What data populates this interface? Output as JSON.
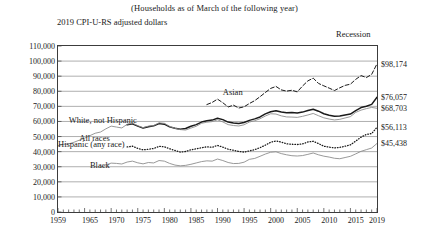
{
  "subtitle": "(Households as of March of the following year)",
  "y_caption": "2019 CPI-U-RS adjusted dollars",
  "recession_label": "Recession",
  "chart_data": {
    "type": "line",
    "title": "",
    "subtitle": "(Households as of March of the following year)",
    "xlabel": "",
    "ylabel": "2019 CPI-U-RS adjusted dollars",
    "xlim": [
      1959,
      2019
    ],
    "ylim": [
      0,
      110000
    ],
    "ytick_step": 10000,
    "grid": "horizontal",
    "legend": "inline-annotations",
    "ytick_labels": [
      "0",
      "10,000",
      "20,000",
      "30,000",
      "40,000",
      "50,000",
      "60,000",
      "70,000",
      "80,000",
      "90,000",
      "100,000",
      "110,000"
    ],
    "yticks": [
      0,
      10000,
      20000,
      30000,
      40000,
      50000,
      60000,
      70000,
      80000,
      90000,
      100000,
      110000
    ],
    "xtick_labels": [
      "1959",
      "1965",
      "1970",
      "1975",
      "1980",
      "1985",
      "1990",
      "1995",
      "2000",
      "2005",
      "2010",
      "2015",
      "2019"
    ],
    "xticks": [
      1959,
      1965,
      1970,
      1975,
      1980,
      1985,
      1990,
      1995,
      2000,
      2005,
      2010,
      2015,
      2019
    ],
    "endpoint_labels": [
      {
        "series": "Asian",
        "value": 98174,
        "text": "$98,174"
      },
      {
        "series": "White, not Hispanic",
        "value": 76057,
        "text": "$76,057"
      },
      {
        "series": "All races",
        "value": 68703,
        "text": "$68,703"
      },
      {
        "series": "Hispanic (any race)",
        "value": 56113,
        "text": "$56,113"
      },
      {
        "series": "Black",
        "value": 45438,
        "text": "$45,438"
      }
    ],
    "annotations": [
      {
        "text": "Asian",
        "x": 1990,
        "y": 79000
      },
      {
        "text": "White, not Hispanic",
        "x": 1961,
        "y": 60500
      },
      {
        "text": "All races",
        "x": 1963,
        "y": 48500
      },
      {
        "text": "Hispanic (any race)",
        "x": 1959,
        "y": 44500
      },
      {
        "text": "Black",
        "x": 1965,
        "y": 30500
      },
      {
        "text": "Recession",
        "x": 2017,
        "y": 115000
      }
    ],
    "series": [
      {
        "name": "Asian",
        "style": "dashed",
        "color": "#1a1a1a",
        "x": [
          1987,
          1988,
          1989,
          1990,
          1991,
          1992,
          1993,
          1994,
          1995,
          1996,
          1997,
          1998,
          1999,
          2000,
          2001,
          2002,
          2003,
          2004,
          2005,
          2006,
          2007,
          2008,
          2009,
          2010,
          2011,
          2012,
          2013,
          2014,
          2015,
          2016,
          2017,
          2018,
          2019
        ],
        "values": [
          71200,
          72600,
          74800,
          72400,
          69600,
          70800,
          68900,
          69700,
          71900,
          73800,
          76400,
          79200,
          81900,
          83200,
          80900,
          80100,
          80700,
          79600,
          83500,
          86900,
          88700,
          85200,
          83600,
          82100,
          80500,
          82300,
          83900,
          84700,
          87900,
          90400,
          89100,
          91200,
          98174
        ]
      },
      {
        "name": "White, not Hispanic",
        "style": "solid-thick",
        "color": "#1a1a1a",
        "x": [
          1972,
          1973,
          1974,
          1975,
          1976,
          1977,
          1978,
          1979,
          1980,
          1981,
          1982,
          1983,
          1984,
          1985,
          1986,
          1987,
          1988,
          1989,
          1990,
          1991,
          1992,
          1993,
          1994,
          1995,
          1996,
          1997,
          1998,
          1999,
          2000,
          2001,
          2002,
          2003,
          2004,
          2005,
          2006,
          2007,
          2008,
          2009,
          2010,
          2011,
          2012,
          2013,
          2014,
          2015,
          2016,
          2017,
          2018,
          2019
        ],
        "values": [
          57800,
          58400,
          56900,
          55600,
          56500,
          57100,
          58600,
          58200,
          56400,
          55500,
          54900,
          55300,
          56800,
          57900,
          59600,
          60400,
          60900,
          62100,
          61200,
          59600,
          59000,
          58600,
          59300,
          60700,
          61700,
          63000,
          65000,
          66400,
          67100,
          66200,
          65800,
          65900,
          65600,
          66200,
          67200,
          68100,
          66800,
          65100,
          64100,
          63400,
          63600,
          64300,
          64900,
          67200,
          69200,
          70100,
          71300,
          76057
        ]
      },
      {
        "name": "All races",
        "style": "solid-thin",
        "color": "#8d8d8d",
        "x": [
          1959,
          1960,
          1961,
          1962,
          1963,
          1964,
          1965,
          1966,
          1967,
          1968,
          1969,
          1970,
          1971,
          1972,
          1973,
          1974,
          1975,
          1976,
          1977,
          1978,
          1979,
          1980,
          1981,
          1982,
          1983,
          1984,
          1985,
          1986,
          1987,
          1988,
          1989,
          1990,
          1991,
          1992,
          1993,
          1994,
          1995,
          1996,
          1997,
          1998,
          1999,
          2000,
          2001,
          2002,
          2003,
          2004,
          2005,
          2006,
          2007,
          2008,
          2009,
          2010,
          2011,
          2012,
          2013,
          2014,
          2015,
          2016,
          2017,
          2018,
          2019
        ],
        "values": [
          43900,
          44800,
          45100,
          46200,
          47600,
          48900,
          50600,
          52200,
          53000,
          55100,
          56900,
          56300,
          55700,
          58100,
          58900,
          57200,
          55900,
          56900,
          57300,
          59100,
          58800,
          56700,
          55500,
          54600,
          54300,
          55600,
          56800,
          58800,
          59500,
          59900,
          61100,
          59700,
          57900,
          57300,
          57000,
          57800,
          59600,
          60500,
          61800,
          63600,
          65100,
          64900,
          63700,
          63000,
          62900,
          62700,
          63400,
          64300,
          65300,
          63800,
          62400,
          61600,
          61000,
          61400,
          62300,
          63200,
          66000,
          67500,
          68500,
          69300,
          68703
        ]
      },
      {
        "name": "Hispanic (any race)",
        "style": "dotted",
        "color": "#1a1a1a",
        "x": [
          1972,
          1973,
          1974,
          1975,
          1976,
          1977,
          1978,
          1979,
          1980,
          1981,
          1982,
          1983,
          1984,
          1985,
          1986,
          1987,
          1988,
          1989,
          1990,
          1991,
          1992,
          1993,
          1994,
          1995,
          1996,
          1997,
          1998,
          1999,
          2000,
          2001,
          2002,
          2003,
          2004,
          2005,
          2006,
          2007,
          2008,
          2009,
          2010,
          2011,
          2012,
          2013,
          2014,
          2015,
          2016,
          2017,
          2018,
          2019
        ],
        "values": [
          43100,
          43600,
          42200,
          41200,
          41600,
          42100,
          43500,
          43200,
          41900,
          40800,
          39700,
          40100,
          41200,
          41900,
          42600,
          43200,
          42900,
          44100,
          43000,
          41600,
          40900,
          40100,
          39700,
          40500,
          41300,
          42600,
          44300,
          46200,
          47100,
          46300,
          45200,
          44900,
          44700,
          45100,
          46400,
          46900,
          45300,
          43600,
          43000,
          42500,
          42800,
          43600,
          44500,
          47000,
          49600,
          51400,
          52000,
          56113
        ]
      },
      {
        "name": "Black",
        "style": "solid-thin",
        "color": "#8d8d8d",
        "x": [
          1967,
          1968,
          1969,
          1970,
          1971,
          1972,
          1973,
          1974,
          1975,
          1976,
          1977,
          1978,
          1979,
          1980,
          1981,
          1982,
          1983,
          1984,
          1985,
          1986,
          1987,
          1988,
          1989,
          1990,
          1991,
          1992,
          1993,
          1994,
          1995,
          1996,
          1997,
          1998,
          1999,
          2000,
          2001,
          2002,
          2003,
          2004,
          2005,
          2006,
          2007,
          2008,
          2009,
          2010,
          2011,
          2012,
          2013,
          2014,
          2015,
          2016,
          2017,
          2018,
          2019
        ],
        "values": [
          29600,
          31200,
          32400,
          32200,
          31800,
          33100,
          33700,
          32600,
          31900,
          32800,
          32500,
          34100,
          33700,
          32200,
          31100,
          30600,
          30900,
          31600,
          32500,
          33400,
          33900,
          33700,
          35100,
          34100,
          32800,
          32100,
          32200,
          33000,
          34900,
          35500,
          36900,
          38400,
          39600,
          39900,
          38700,
          37900,
          37300,
          37100,
          37400,
          38200,
          39100,
          37900,
          37000,
          36400,
          35600,
          35300,
          36100,
          36900,
          38500,
          40200,
          41300,
          42400,
          45438
        ]
      }
    ]
  }
}
